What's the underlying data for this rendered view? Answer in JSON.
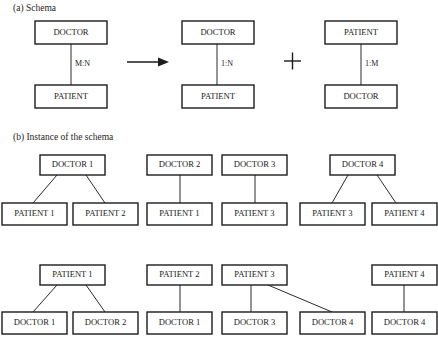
{
  "figure": {
    "width": 438,
    "height": 351,
    "background": "#ffffff",
    "line_color": "#1c1c1c",
    "text_color": "#1a1a1a"
  },
  "sections": {
    "a": {
      "caption": "(a)  Schema"
    },
    "b": {
      "caption": "(b)  Instance of the schema"
    }
  },
  "schema": {
    "left_group": {
      "top_box": "DOCTOR",
      "bottom_box": "PATIENT",
      "cardinality": "M:N"
    },
    "middle_group": {
      "top_box": "DOCTOR",
      "bottom_box": "PATIENT",
      "cardinality": "1:N"
    },
    "right_group": {
      "top_box": "PATIENT",
      "bottom_box": "DOCTOR",
      "cardinality": "1:M"
    },
    "operators": {
      "arrow": "arrow-right",
      "plus": "+"
    }
  },
  "instance": {
    "row1": {
      "parents": [
        "DOCTOR 1",
        "DOCTOR 2",
        "DOCTOR 3",
        "DOCTOR 4"
      ],
      "children": [
        "PATIENT 1",
        "PATIENT 2",
        "PATIENT 1",
        "PATIENT 3",
        "PATIENT 3",
        "PATIENT 4"
      ]
    },
    "row2": {
      "parents": [
        "PATIENT 1",
        "PATIENT 2",
        "PATIENT 3",
        "PATIENT 4"
      ],
      "children": [
        "DOCTOR 1",
        "DOCTOR 2",
        "DOCTOR 1",
        "DOCTOR 3",
        "DOCTOR 4",
        "DOCTOR 4"
      ]
    }
  }
}
